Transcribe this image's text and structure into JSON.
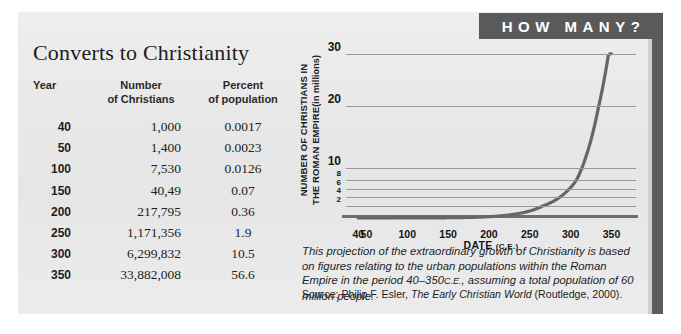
{
  "banner": {
    "label": "HOW MANY?"
  },
  "table": {
    "title": "Converts to Christianity",
    "headers": {
      "year": "Year",
      "number_line1": "Number",
      "number_line2": "of Christians",
      "percent_line1": "Percent",
      "percent_line2": "of population"
    },
    "rows": [
      {
        "year": "40",
        "number": "1,000",
        "percent": "0.0017"
      },
      {
        "year": "50",
        "number": "1,400",
        "percent": "0.0023"
      },
      {
        "year": "100",
        "number": "7,530",
        "percent": "0.0126"
      },
      {
        "year": "150",
        "number": "40,49",
        "percent": "0.07"
      },
      {
        "year": "200",
        "number": "217,795",
        "percent": "0.36"
      },
      {
        "year": "250",
        "number": "1,171,356",
        "percent": "1.9"
      },
      {
        "year": "300",
        "number": "6,299,832",
        "percent": "10.5"
      },
      {
        "year": "350",
        "number": "33,882,008",
        "percent": "56.6"
      }
    ]
  },
  "chart_data": {
    "type": "line",
    "title": "",
    "xlabel": "DATE (C.E.)",
    "xlabel_main": "DATE",
    "xlabel_unit": "(C.E.)",
    "ylabel_line1": "NUMBER OF CHRISTIANS IN",
    "ylabel_line2": "THE ROMAN EMPIRE",
    "ylabel_unit": "(in millions)",
    "x": [
      40,
      50,
      100,
      150,
      200,
      250,
      300,
      350
    ],
    "xticklabels": [
      "40",
      "50",
      "100",
      "150",
      "200",
      "250",
      "300",
      "350"
    ],
    "yticklabels": [
      "30",
      "20",
      "10",
      "8",
      "6",
      "4",
      "2"
    ],
    "ytickvalues": [
      30,
      20,
      10,
      8,
      6,
      4,
      2
    ],
    "values": [
      0.001,
      0.0014,
      0.00753,
      0.04049,
      0.217795,
      1.171356,
      6.299832,
      33.882008
    ],
    "series": [
      {
        "name": "Christians in the Roman Empire (millions)",
        "values": [
          0.001,
          0.0014,
          0.00753,
          0.04049,
          0.217795,
          1.171356,
          6.299832,
          33.882008
        ]
      }
    ],
    "xlim": [
      25,
      380
    ],
    "ylim": [
      0,
      33.9
    ],
    "grid": true,
    "legend": "none",
    "line_color": "#666666"
  },
  "caption": {
    "text_line1": "This projection of the extraordinary growth of Christianity is based on",
    "text_line2": "figures relating to the urban populations within the Roman Empire in the",
    "text_line3_a": "period 40–350",
    "text_line3_sc": "C.E.",
    "text_line3_b": ", assuming a total population of 60 million people.",
    "source_prefix": "Source: Philip F. Esler,",
    "source_title": "The Early Christian World",
    "source_suffix": "(Routledge, 2000)."
  },
  "colors": {
    "panel": "#e9e9e9",
    "banner": "#5a5a5a",
    "spine": "#5c5c5c",
    "curve": "#666666",
    "grid": "#9a9a9a",
    "text": "#1d1d1d"
  }
}
